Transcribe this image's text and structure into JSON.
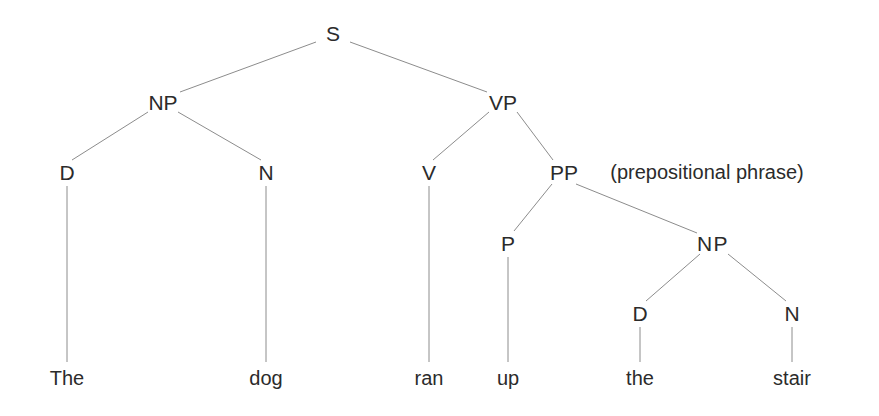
{
  "diagram": {
    "type": "constituency-parse-tree",
    "background_color": "#ffffff",
    "line_color": "#8c8c8c",
    "text_color": "#2b2b2b",
    "sentence": "The dog ran up the stair"
  },
  "nodes": {
    "s": {
      "label": "S",
      "x": 333,
      "y": 33
    },
    "np_subject": {
      "label": "NP",
      "x": 163,
      "y": 102
    },
    "vp": {
      "label": "VP",
      "x": 503,
      "y": 102
    },
    "d_subject": {
      "label": "D",
      "x": 67,
      "y": 172
    },
    "n_subject": {
      "label": "N",
      "x": 266,
      "y": 172
    },
    "v": {
      "label": "V",
      "x": 429,
      "y": 172
    },
    "pp": {
      "label": "PP",
      "x": 564,
      "y": 172
    },
    "pp_annotation": {
      "label": "(prepositional phrase)",
      "x": 707,
      "y": 172
    },
    "p": {
      "label": "P",
      "x": 508,
      "y": 243
    },
    "np_object": {
      "label": "NP",
      "x": 713,
      "y": 243
    },
    "d_object": {
      "label": "D",
      "x": 640,
      "y": 313
    },
    "n_object": {
      "label": "N",
      "x": 792,
      "y": 313
    }
  },
  "leaves": {
    "the_subject": {
      "label": "The",
      "x": 67,
      "y": 378
    },
    "dog": {
      "label": "dog",
      "x": 266,
      "y": 378
    },
    "ran": {
      "label": "ran",
      "x": 429,
      "y": 378
    },
    "up": {
      "label": "up",
      "x": 508,
      "y": 378
    },
    "the_object": {
      "label": "the",
      "x": 640,
      "y": 378
    },
    "stair": {
      "label": "stair",
      "x": 792,
      "y": 378
    }
  },
  "edges": [
    {
      "from": "s",
      "to": "np_subject",
      "x1": 316,
      "y1": 42,
      "x2": 180,
      "y2": 92
    },
    {
      "from": "s",
      "to": "vp",
      "x1": 350,
      "y1": 42,
      "x2": 487,
      "y2": 92
    },
    {
      "from": "np_subject",
      "to": "d_subject",
      "x1": 148,
      "y1": 112,
      "x2": 72,
      "y2": 160
    },
    {
      "from": "np_subject",
      "to": "n_subject",
      "x1": 178,
      "y1": 112,
      "x2": 261,
      "y2": 160
    },
    {
      "from": "vp",
      "to": "v",
      "x1": 489,
      "y1": 112,
      "x2": 433,
      "y2": 160
    },
    {
      "from": "vp",
      "to": "pp",
      "x1": 517,
      "y1": 112,
      "x2": 553,
      "y2": 160
    },
    {
      "from": "d_subject",
      "to": "the_subject",
      "x1": 67,
      "y1": 186,
      "x2": 67,
      "y2": 362
    },
    {
      "from": "n_subject",
      "to": "dog",
      "x1": 266,
      "y1": 186,
      "x2": 266,
      "y2": 362
    },
    {
      "from": "v",
      "to": "ran",
      "x1": 429,
      "y1": 186,
      "x2": 429,
      "y2": 362
    },
    {
      "from": "pp",
      "to": "p",
      "x1": 552,
      "y1": 184,
      "x2": 514,
      "y2": 231
    },
    {
      "from": "pp",
      "to": "np_object",
      "x1": 576,
      "y1": 184,
      "x2": 697,
      "y2": 233
    },
    {
      "from": "p",
      "to": "up",
      "x1": 508,
      "y1": 257,
      "x2": 508,
      "y2": 362
    },
    {
      "from": "np_object",
      "to": "d_object",
      "x1": 700,
      "y1": 254,
      "x2": 646,
      "y2": 301
    },
    {
      "from": "np_object",
      "to": "n_object",
      "x1": 728,
      "y1": 254,
      "x2": 786,
      "y2": 301
    },
    {
      "from": "d_object",
      "to": "the_object",
      "x1": 640,
      "y1": 327,
      "x2": 640,
      "y2": 362
    },
    {
      "from": "n_object",
      "to": "stair",
      "x1": 792,
      "y1": 327,
      "x2": 792,
      "y2": 362
    }
  ]
}
